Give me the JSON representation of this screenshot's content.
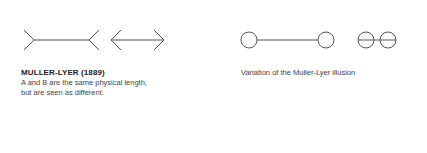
{
  "left_panel": {
    "title": "MULLER-LYER (1889)",
    "description_line1": "A and B are the same physical length,",
    "description_line2": "but are seen as different."
  },
  "right_panel": {
    "caption": "Variation of the Muller-Lyer illusion"
  },
  "colors": {
    "line": "#555555",
    "text": "#333333"
  }
}
